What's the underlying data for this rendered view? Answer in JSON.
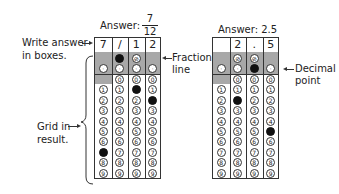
{
  "left_example": {
    "answer_label": "Answer:",
    "answer_fraction": {
      "numerator": "7",
      "denominator": "12"
    },
    "boxes": [
      "7",
      "/",
      "1",
      "2"
    ],
    "filled": {
      "slash": [
        1
      ],
      "decimal": [],
      "digits": {
        "0": 7,
        "2": 1,
        "3": 2
      }
    },
    "callouts": {
      "write_answer": "Write answer in boxes.",
      "write_answer_line1": "Write answer",
      "write_answer_line2": "in boxes.",
      "grid_in_line1": "Grid in",
      "grid_in_line2": "result.",
      "fraction_line_1": "Fraction",
      "fraction_line_2": "line"
    }
  },
  "right_example": {
    "answer_label": "Answer: 2.5",
    "boxes": [
      "",
      "2",
      ".",
      "5"
    ],
    "filled": {
      "slash": [],
      "decimal": [
        2
      ],
      "digits": {
        "1": 2,
        "3": 5
      }
    },
    "callouts": {
      "decimal_point_1": "Decimal",
      "decimal_point_2": "point"
    }
  },
  "bubble_symbols": {
    "slash": "⊘",
    "decimal": "·"
  },
  "digits": [
    "0",
    "1",
    "2",
    "3",
    "4",
    "5",
    "6",
    "7",
    "8",
    "9"
  ],
  "colors": {
    "shade": "#a8a8a8",
    "ink": "#222222",
    "fill": "#111111"
  }
}
